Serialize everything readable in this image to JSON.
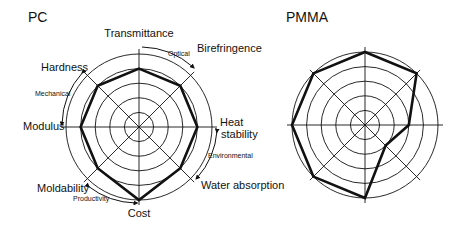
{
  "chart_data": [
    {
      "type": "radar",
      "title": "PC",
      "axes": [
        "Transmittance",
        "Birefringence",
        "Heat stability",
        "Water absorption",
        "Cost",
        "Moldability",
        "Modulus",
        "Hardness"
      ],
      "values": [
        4,
        4,
        4,
        4,
        5,
        4,
        4,
        4
      ],
      "range": [
        0,
        5
      ],
      "rings": 5,
      "groups": [
        {
          "label": "Optical",
          "axes": [
            "Transmittance",
            "Birefringence"
          ]
        },
        {
          "label": "Environmental",
          "axes": [
            "Heat stability",
            "Water absorption"
          ]
        },
        {
          "label": "Productivity",
          "axes": [
            "Cost",
            "Moldability"
          ]
        },
        {
          "label": "Mechanical",
          "axes": [
            "Modulus",
            "Hardness"
          ]
        }
      ]
    },
    {
      "type": "radar",
      "title": "PMMA",
      "axes": [
        "Transmittance",
        "Birefringence",
        "Heat stability",
        "Water absorption",
        "Cost",
        "Moldability",
        "Modulus",
        "Hardness"
      ],
      "values": [
        5,
        5,
        3,
        2,
        5,
        5,
        5,
        5
      ],
      "range": [
        0,
        5
      ],
      "rings": 5
    }
  ],
  "labels": {
    "pc_title": "PC",
    "pmma_title": "PMMA",
    "transmittance": "Transmittance",
    "birefringence": "Birefringence",
    "heat": "Heat",
    "stability": "stability",
    "water_absorption": "Water absorption",
    "cost": "Cost",
    "moldability": "Moldability",
    "modulus": "Modulus",
    "hardness": "Hardness",
    "optical": "Optical",
    "environmental": "Environmental",
    "productivity": "Productivity",
    "mechanical": "Mechanical"
  }
}
